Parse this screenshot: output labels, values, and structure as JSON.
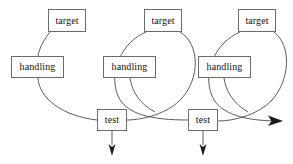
{
  "diagram": {
    "background_color": "#ffffff",
    "line_color": "#4a4a4a",
    "arrow_color": "#1a1a1a",
    "box_border_color": "#6b6b6b",
    "text_color": "#111111",
    "nodes": [
      {
        "id": "target-1",
        "label": "target",
        "x": 48,
        "y": 9,
        "w": 38,
        "h": 23
      },
      {
        "id": "handling-1",
        "label": "handling",
        "x": 11,
        "y": 56,
        "w": 53,
        "h": 22
      },
      {
        "id": "test-1",
        "label": "test",
        "x": 97,
        "y": 109,
        "w": 30,
        "h": 22
      },
      {
        "id": "target-2",
        "label": "target",
        "x": 144,
        "y": 9,
        "w": 38,
        "h": 23
      },
      {
        "id": "handling-2",
        "label": "handling",
        "x": 103,
        "y": 56,
        "w": 53,
        "h": 22
      },
      {
        "id": "test-2",
        "label": "test",
        "x": 188,
        "y": 109,
        "w": 30,
        "h": 22
      },
      {
        "id": "target-3",
        "label": "target",
        "x": 238,
        "y": 9,
        "w": 38,
        "h": 23
      },
      {
        "id": "handling-3",
        "label": "handling",
        "x": 198,
        "y": 56,
        "w": 53,
        "h": 22
      }
    ],
    "edges": [
      {
        "id": "edge-target1-handling1",
        "from": "target-1",
        "to": "handling-1",
        "kind": "curve"
      },
      {
        "id": "edge-handling1-test1",
        "from": "handling-1",
        "to": "test-1",
        "kind": "curve"
      },
      {
        "id": "edge-target2-loopleft",
        "from": "target-2",
        "to": "test-1",
        "kind": "loop-left"
      },
      {
        "id": "edge-target2-loopright",
        "from": "target-2",
        "to": "test-2",
        "kind": "loop-right"
      },
      {
        "id": "edge-test1-target3",
        "from": "test-1",
        "to": "target-3",
        "kind": "curve"
      },
      {
        "id": "edge-target3-loopleft",
        "from": "target-3",
        "to": "test-2",
        "kind": "loop-left"
      },
      {
        "id": "edge-target3-loopright",
        "from": "target-3",
        "to": "exit",
        "kind": "loop-right"
      }
    ],
    "arrows": [
      {
        "id": "arrow-test1-down",
        "direction": "down",
        "x": 112,
        "y": 155
      },
      {
        "id": "arrow-test2-down",
        "direction": "down",
        "x": 203,
        "y": 155
      },
      {
        "id": "arrow-exit-right",
        "direction": "right",
        "x": 280,
        "y": 121
      }
    ]
  }
}
